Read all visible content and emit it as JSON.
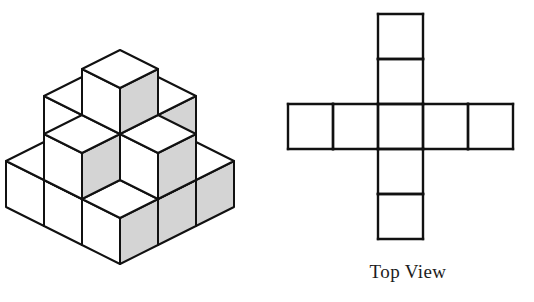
{
  "figure": {
    "background_color": "#ffffff",
    "line_color": "#111111",
    "face_colors": {
      "top": "#ffffff",
      "left": "#ffffff",
      "right": "#d4d4d4"
    }
  },
  "iso_view": {
    "label": "isometric-cube-stack",
    "description": "Isometric drawing of unit cubes stacked in multiple levels",
    "cube_size": 46,
    "projection": {
      "dx": 38,
      "dy": 19,
      "height": 46
    },
    "origin": {
      "x": 120,
      "y": 150
    },
    "cubes": [
      {
        "x": 0,
        "y": 0,
        "z": 0
      },
      {
        "x": 1,
        "y": 0,
        "z": 0
      },
      {
        "x": 2,
        "y": 0,
        "z": 0
      },
      {
        "x": 0,
        "y": 1,
        "z": 0
      },
      {
        "x": 1,
        "y": 1,
        "z": 0
      },
      {
        "x": 2,
        "y": 1,
        "z": 0
      },
      {
        "x": 0,
        "y": 2,
        "z": 0
      },
      {
        "x": 1,
        "y": 2,
        "z": 0
      },
      {
        "x": 2,
        "y": 2,
        "z": 0
      },
      {
        "x": 0,
        "y": 1,
        "z": 1
      },
      {
        "x": 1,
        "y": 1,
        "z": 1
      },
      {
        "x": 2,
        "y": 1,
        "z": 1
      },
      {
        "x": 1,
        "y": 0,
        "z": 1
      },
      {
        "x": 1,
        "y": 2,
        "z": 1
      },
      {
        "x": 1,
        "y": 1,
        "z": 2
      }
    ]
  },
  "top_view": {
    "caption": "Top View",
    "label": "top-view-cross-grid",
    "cell_size": 45,
    "grid_origin": {
      "x": 6,
      "y": 14
    },
    "columns": 5,
    "rows": 5,
    "shape": "plus",
    "cells": [
      {
        "col": 2,
        "row": 0
      },
      {
        "col": 2,
        "row": 1
      },
      {
        "col": 0,
        "row": 2
      },
      {
        "col": 1,
        "row": 2
      },
      {
        "col": 2,
        "row": 2
      },
      {
        "col": 3,
        "row": 2
      },
      {
        "col": 4,
        "row": 2
      },
      {
        "col": 2,
        "row": 3
      },
      {
        "col": 2,
        "row": 4
      }
    ]
  }
}
